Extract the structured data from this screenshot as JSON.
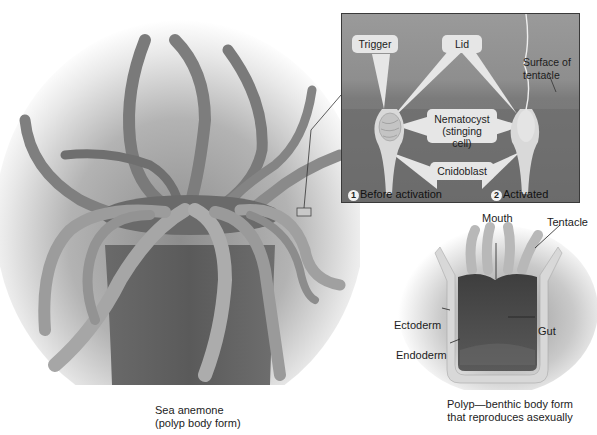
{
  "figure": {
    "main_illustration": {
      "subject": "sea-anemone",
      "caption_line1": "Sea anemone",
      "caption_line2": "(polyp body form)"
    },
    "inset": {
      "callouts": {
        "trigger": "Trigger",
        "lid": "Lid",
        "nematocyst_line1": "Nematocyst",
        "nematocyst_line2": "(stinging cell)",
        "cnidoblast": "Cnidoblast"
      },
      "surface_label_line1": "Surface of",
      "surface_label_line2": "tentacle",
      "steps": [
        {
          "number": "1",
          "label": "Before activation"
        },
        {
          "number": "2",
          "label": "Activated"
        }
      ]
    },
    "polyp_diagram": {
      "labels": {
        "mouth": "Mouth",
        "tentacle": "Tentacle",
        "ectoderm": "Ectoderm",
        "endoderm": "Endoderm",
        "gut": "Gut"
      },
      "caption_line1": "Polyp—benthic body form",
      "caption_line2": "that reproduces asexually"
    },
    "colors": {
      "background": "#ffffff",
      "inset_bg": "#8a8a8a",
      "callout_bg": "#e6e6e6",
      "body_dark": "#5a5a5a",
      "tentacle_light": "#b8b8b8"
    }
  }
}
